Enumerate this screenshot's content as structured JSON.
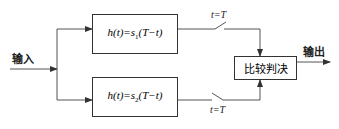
{
  "diagram": {
    "type": "matched-filter receiver block diagram",
    "input_label": "输入",
    "output_label": "输出",
    "filters": [
      {
        "h": "h",
        "t": "t",
        "s": "s",
        "sub": "1",
        "arg": "T−t",
        "formula": "h(t)=s1(T−t)"
      },
      {
        "h": "h",
        "t": "t",
        "s": "s",
        "sub": "2",
        "arg": "T−t",
        "formula": "h(t)=s2(T−t)"
      }
    ],
    "switches": [
      {
        "label": "t=T"
      },
      {
        "label": "t=T"
      }
    ],
    "decision_block": {
      "label": "比较判决"
    },
    "colors": {
      "line": "#333333",
      "text": "#222222",
      "background": "#ffffff"
    }
  }
}
